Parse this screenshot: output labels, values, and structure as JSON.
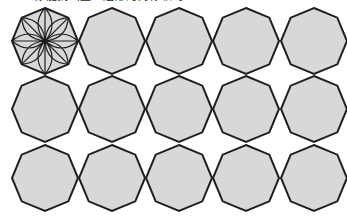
{
  "caption": {
    "text": "你能找出正八边形的对称轴吗？",
    "clipped": true
  },
  "figure": {
    "shape": "regular-octagon",
    "rows": 3,
    "columns": 5,
    "row_centers_y": [
      41,
      109,
      178
    ],
    "column_centers_x": [
      45,
      112,
      179,
      246,
      314
    ],
    "radius": 33,
    "fill_color": "#d8d8d8",
    "stroke_color": "#1e1e1e",
    "highlighted_cell": {
      "row": 0,
      "column": 0,
      "pattern": "eight-petal-flower",
      "petals": 8
    }
  }
}
